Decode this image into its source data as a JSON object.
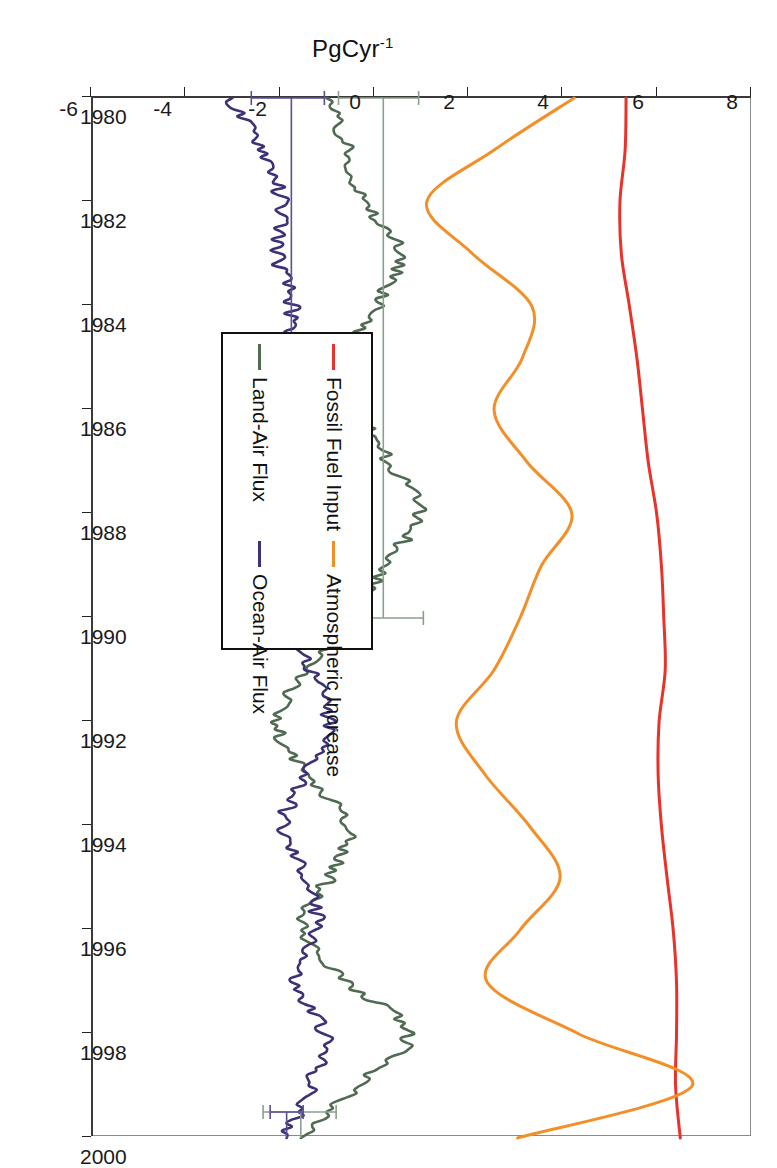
{
  "chart_data": {
    "type": "line",
    "title": "",
    "xlabel": "",
    "ylabel": "PgCyr",
    "ylabel_sup": "-1",
    "orientation": "rotated-90-clockwise",
    "grid": false,
    "legend_position": "inside-center-right",
    "xlim": [
      1980,
      2000
    ],
    "ylim": [
      -6,
      8
    ],
    "xticks": [
      "1980",
      "1982",
      "1984",
      "1986",
      "1988",
      "1990",
      "1992",
      "1994",
      "1996",
      "1998",
      "2000"
    ],
    "yticks": [
      "8",
      "6",
      "4",
      "2",
      "0",
      "-2",
      "-4",
      "-6"
    ],
    "series": [
      {
        "name": "Fossil Fuel Input",
        "color": "#e8322a",
        "x": [
          1980,
          1981,
          1982,
          1983,
          1984,
          1985,
          1986,
          1987,
          1988,
          1989,
          1990,
          1991,
          1992,
          1993,
          1994,
          1995,
          1996,
          1997,
          1998,
          1999,
          2000
        ],
        "values": [
          5.35,
          5.33,
          5.22,
          5.25,
          5.42,
          5.58,
          5.7,
          5.82,
          6.0,
          6.1,
          6.15,
          6.18,
          6.05,
          6.03,
          6.1,
          6.22,
          6.35,
          6.42,
          6.42,
          6.4,
          6.5
        ]
      },
      {
        "name": "Atmospheric Increase",
        "color": "#f28f28",
        "x": [
          1980,
          1981,
          1982,
          1983,
          1984,
          1985,
          1986,
          1987,
          1988,
          1989,
          1990,
          1991,
          1992,
          1993,
          1994,
          1995,
          1996,
          1997,
          1998,
          1999,
          2000
        ],
        "values": [
          4.25,
          2.55,
          1.12,
          2.1,
          3.35,
          3.15,
          2.55,
          3.25,
          4.2,
          3.55,
          3.1,
          2.55,
          1.75,
          2.35,
          3.3,
          3.95,
          3.1,
          2.4,
          4.35,
          6.75,
          3.05
        ]
      },
      {
        "name": "Land-Air Flux",
        "color": "#4f6b52",
        "x": [
          1980,
          1981,
          1982,
          1983,
          1984,
          1985,
          1986,
          1987,
          1988,
          1989,
          1990,
          1991,
          1992,
          1993,
          1994,
          1995,
          1996,
          1997,
          1998,
          1999,
          2000
        ],
        "values": [
          -0.95,
          -0.55,
          -0.2,
          0.55,
          0.05,
          -0.55,
          -0.35,
          0.35,
          0.95,
          0.2,
          -0.35,
          -1.35,
          -2.05,
          -1.45,
          -0.55,
          -0.95,
          -1.55,
          -0.55,
          0.75,
          -0.35,
          -1.55
        ]
      },
      {
        "name": "Ocean-Air Flux",
        "color": "#3c3276",
        "x": [
          1980,
          1981,
          1982,
          1983,
          1984,
          1985,
          1986,
          1987,
          1988,
          1989,
          1990,
          1991,
          1992,
          1993,
          1994,
          1995,
          1996,
          1997,
          1998,
          1999,
          2000
        ],
        "values": [
          -3.05,
          -2.35,
          -1.95,
          -2.05,
          -1.75,
          -1.85,
          -1.95,
          -1.7,
          -1.45,
          -1.6,
          -1.8,
          -1.35,
          -0.95,
          -1.45,
          -1.95,
          -1.45,
          -1.2,
          -1.7,
          -1.05,
          -1.35,
          -1.85
        ]
      }
    ],
    "error_bars": [
      {
        "series": "Land-Air Flux",
        "x": 1980,
        "value": 0.1,
        "err_low": -0.75,
        "err_high": 0.95,
        "color": "#8aa08c"
      },
      {
        "series": "Ocean-Air Flux",
        "x": 1980,
        "value": -1.8,
        "err_low": -2.6,
        "err_high": -1.05,
        "color": "#5a4f96"
      },
      {
        "series": "Land-Air Flux",
        "x": 1990,
        "value": 0.2,
        "err_low": -0.65,
        "err_high": 1.05,
        "color": "#8aa08c"
      },
      {
        "series": "Ocean-Air Flux",
        "x": 1990,
        "value": -1.75,
        "err_low": -2.55,
        "err_high": -0.95,
        "color": "#5a4f96"
      },
      {
        "series": "Land-Air Flux",
        "x": 1999.5,
        "value": -1.55,
        "err_low": -2.35,
        "err_high": -0.8,
        "color": "#8aa08c"
      },
      {
        "series": "Ocean-Air Flux",
        "x": 1999.5,
        "value": -1.85,
        "err_low": -2.2,
        "err_high": -1.5,
        "color": "#5a4f96"
      }
    ]
  },
  "legend": {
    "items": [
      {
        "label": "Fossil Fuel Input",
        "color": "#e8322a"
      },
      {
        "label": "Atmospheric Increase",
        "color": "#f28f28"
      },
      {
        "label": "Land-Air Flux",
        "color": "#4f6b52"
      },
      {
        "label": "Ocean-Air Flux",
        "color": "#3c3276"
      }
    ]
  }
}
